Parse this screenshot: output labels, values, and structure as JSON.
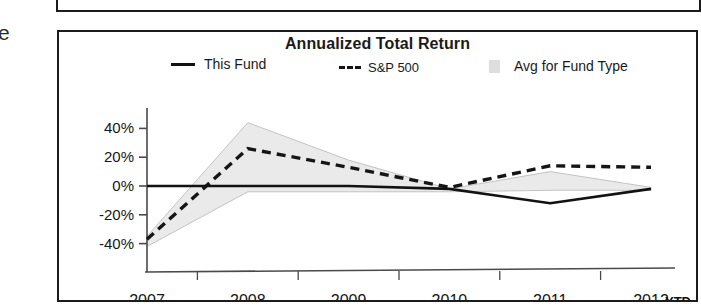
{
  "artifacts": {
    "edge_glyph": "e"
  },
  "chart_panel": {
    "title": "Annualized Total Return",
    "legend": [
      {
        "label": "This Fund",
        "marker": "solid-line-swatch"
      },
      {
        "label": "S&P 500",
        "marker": "dashed-line-swatch"
      },
      {
        "label": "Avg for Fund Type",
        "marker": "gray-box-swatch"
      }
    ],
    "axis_suffix_label": "YTD"
  },
  "colors": {
    "line_this_fund": "#121212",
    "line_sp500": "#151515",
    "band_avg_fund_type": "#d8d8d8",
    "axis": "#4a4a4a",
    "frame": "#1c1c1c"
  },
  "chart_data": {
    "type": "line",
    "title": "Annualized Total Return",
    "xlabel": "",
    "ylabel": "",
    "x": [
      "2007",
      "2008",
      "2009",
      "2010",
      "2011",
      "2012"
    ],
    "tick_labels_y": [
      "40%",
      "20%",
      "0%",
      "-20%",
      "-40%"
    ],
    "ylim": [
      -50,
      50
    ],
    "yticks": [
      40,
      20,
      0,
      -20,
      -40
    ],
    "grid": false,
    "legend_position": "top",
    "annotations": [
      "YTD"
    ],
    "series": [
      {
        "name": "This Fund",
        "style": "solid",
        "values": [
          0,
          0,
          0,
          -2,
          -12,
          -2
        ]
      },
      {
        "name": "S&P 500",
        "style": "dashed",
        "values": [
          -37,
          26,
          13,
          -1,
          14,
          13
        ]
      },
      {
        "name": "Avg for Fund Type",
        "style": "shaded-band",
        "upper": [
          -35,
          44,
          18,
          -2,
          10,
          -1
        ],
        "lower": [
          -42,
          -4,
          -4,
          -4,
          -3,
          -3
        ]
      }
    ]
  }
}
